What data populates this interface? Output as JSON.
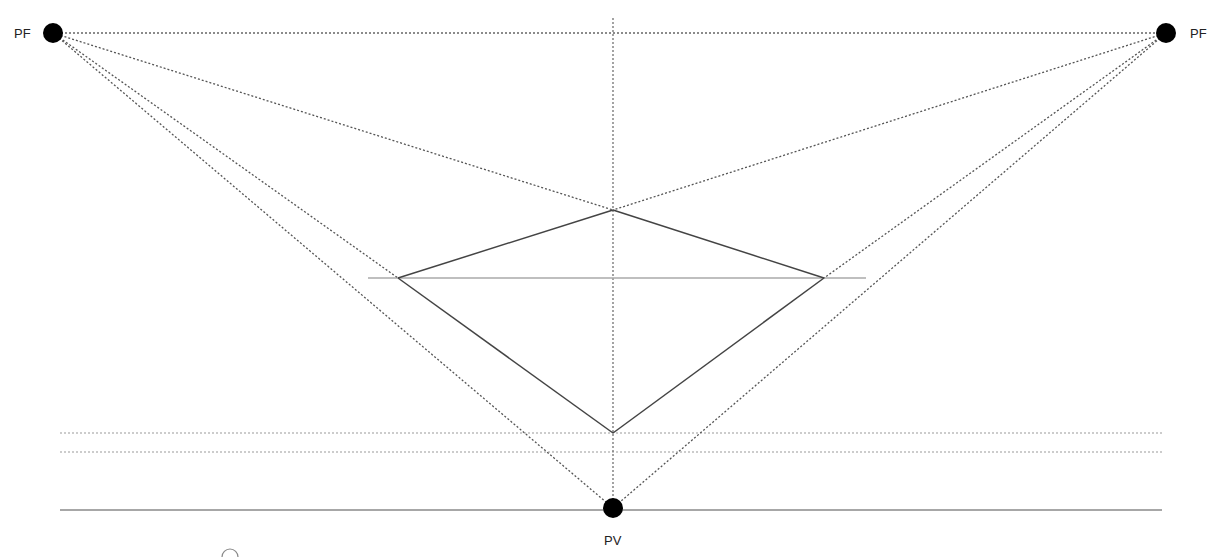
{
  "diagram": {
    "colors": {
      "background": "#ffffff",
      "point": "#000000",
      "construction_line": "#555555",
      "solid_line": "#444444",
      "guide_line": "#999999",
      "label": "#222222"
    },
    "points": [
      {
        "id": "pf_left",
        "label": "PF",
        "x": 53,
        "y": 33,
        "label_x": 14,
        "label_y": 38
      },
      {
        "id": "pf_right",
        "label": "PF",
        "x": 1166,
        "y": 33,
        "label_x": 1190,
        "label_y": 38
      },
      {
        "id": "pv",
        "label": "PV",
        "x": 613,
        "y": 508,
        "label_x": 604,
        "label_y": 545
      }
    ],
    "square_vertices": {
      "top": {
        "x": 613,
        "y": 210
      },
      "left": {
        "x": 398,
        "y": 278
      },
      "right": {
        "x": 824,
        "y": 278
      },
      "bottom": {
        "x": 613,
        "y": 433
      }
    },
    "horizon_line": {
      "x1": 53,
      "y1": 33,
      "x2": 1166,
      "y2": 33
    },
    "vertical_axis": {
      "x1": 613,
      "y1": 18,
      "x2": 613,
      "y2": 508
    },
    "mid_guide": {
      "x1": 368,
      "y1": 278,
      "x2": 866,
      "y2": 278
    },
    "ground_lines": [
      {
        "x1": 60,
        "y1": 433,
        "x2": 1162,
        "y2": 433
      },
      {
        "x1": 60,
        "y1": 452,
        "x2": 1162,
        "y2": 452
      },
      {
        "x1": 60,
        "y1": 510,
        "x2": 1162,
        "y2": 510
      }
    ],
    "rays_from_left_pf": [
      {
        "to": "right",
        "x2": 824,
        "y2": 278
      },
      {
        "to": "pv",
        "x2": 613,
        "y2": 508
      },
      {
        "to": "left",
        "x2": 398,
        "y2": 278
      }
    ],
    "rays_from_right_pf": [
      {
        "to": "left",
        "x2": 398,
        "y2": 278
      },
      {
        "to": "pv",
        "x2": 613,
        "y2": 508
      },
      {
        "to": "right",
        "x2": 824,
        "y2": 278
      }
    ]
  }
}
